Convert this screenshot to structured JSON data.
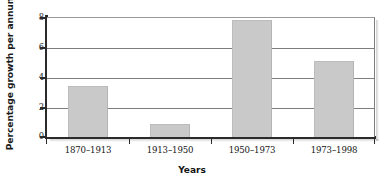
{
  "chart_data": {
    "type": "bar",
    "title": "",
    "xlabel": "Years",
    "ylabel": "Percentage growth per annum",
    "categories": [
      "1870–1913",
      "1913–1950",
      "1950–1973",
      "1973–1998"
    ],
    "values": [
      3.4,
      0.9,
      7.9,
      5.1
    ],
    "ylim": [
      0,
      8
    ],
    "yticks": [
      0,
      2,
      4,
      6,
      8
    ],
    "ytick_labels": [
      "0",
      "2",
      "4",
      "6",
      "8"
    ],
    "grid": "horizontal",
    "legend": "none",
    "bar_color": "#c9c9c9",
    "axis_color": "#2b2b2b",
    "gridline_color": "#7e7e7e",
    "background": "#ffffff"
  }
}
